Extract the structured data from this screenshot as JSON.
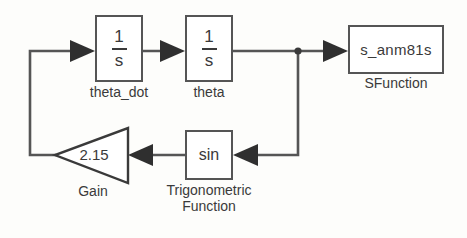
{
  "diagram": {
    "background_color": "#fdfdfb",
    "line_color": "#555555",
    "text_color": "#3a3a3a",
    "blocks": [
      {
        "id": "theta_dot",
        "type": "integrator",
        "numerator": "1",
        "denominator": "s",
        "label": "theta_dot"
      },
      {
        "id": "theta",
        "type": "integrator",
        "numerator": "1",
        "denominator": "s",
        "label": "theta"
      },
      {
        "id": "sfunction",
        "type": "s-function",
        "text": "s_anm81s",
        "label": "SFunction"
      },
      {
        "id": "trig",
        "type": "trigonometric-function",
        "text": "sin",
        "label": "Trigonometric\nFunction"
      },
      {
        "id": "gain",
        "type": "gain",
        "value": "2.15",
        "label": "Gain"
      }
    ]
  }
}
